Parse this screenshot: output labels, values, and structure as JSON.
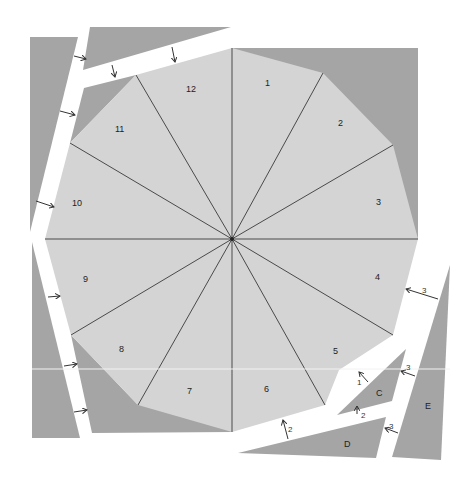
{
  "colors": {
    "background": "#ffffff",
    "dodecagon_fill": "#d4d4d4",
    "leftover_fill": "#a5a5a5",
    "spokes": "#4a4a4a"
  },
  "sectors": [
    {
      "id": "1",
      "label": "1"
    },
    {
      "id": "2",
      "label": "2"
    },
    {
      "id": "3",
      "label": "3"
    },
    {
      "id": "4",
      "label": "4"
    },
    {
      "id": "5",
      "label": "5"
    },
    {
      "id": "6",
      "label": "6"
    },
    {
      "id": "7",
      "label": "7"
    },
    {
      "id": "8",
      "label": "8"
    },
    {
      "id": "9",
      "label": "9"
    },
    {
      "id": "10",
      "label": "10"
    },
    {
      "id": "11",
      "label": "11"
    },
    {
      "id": "12",
      "label": "12"
    }
  ],
  "pieces": [
    {
      "id": "C",
      "label": "C"
    },
    {
      "id": "D",
      "label": "D"
    },
    {
      "id": "E",
      "label": "E"
    }
  ],
  "move_hints": [
    {
      "label": "3",
      "target": "sector-4"
    },
    {
      "label": "1",
      "target": "piece-C"
    },
    {
      "label": "3",
      "target": "piece-C-right"
    },
    {
      "label": "2",
      "target": "piece-C-bottom"
    },
    {
      "label": "2",
      "target": "sector-6"
    },
    {
      "label": "3",
      "target": "piece-D"
    }
  ]
}
